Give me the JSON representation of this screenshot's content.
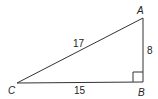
{
  "diagram": {
    "type": "right-triangle",
    "vertices": {
      "A": {
        "label": "A",
        "x": 143,
        "y": 18
      },
      "B": {
        "label": "B",
        "x": 143,
        "y": 82
      },
      "C": {
        "label": "C",
        "x": 17,
        "y": 83
      }
    },
    "sides": {
      "AC": "17",
      "AB": "8",
      "BC": "15"
    },
    "right_angle_at": "B",
    "stroke_color": "#333333"
  }
}
